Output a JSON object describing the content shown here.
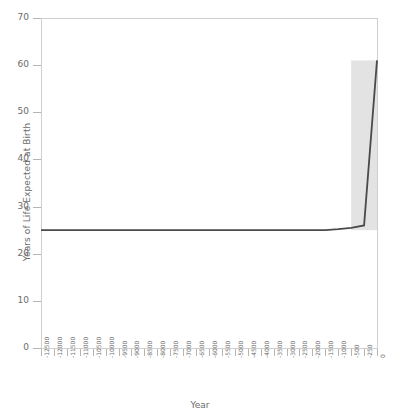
{
  "chart_data": {
    "type": "line",
    "title": "",
    "xlabel": "Year",
    "ylabel": "Years of Life Expected at Birth",
    "ylim": [
      0,
      70
    ],
    "yticks": [
      0,
      10,
      20,
      30,
      40,
      50,
      60,
      70
    ],
    "grid": false,
    "legend": null,
    "categories": [
      "-12500",
      "-12000",
      "-11500",
      "-11000",
      "-10500",
      "-10000",
      "-9500",
      "-9000",
      "-8500",
      "-8000",
      "-7500",
      "-7000",
      "-6500",
      "-6000",
      "-5500",
      "-5000",
      "-4500",
      "-4000",
      "-3500",
      "-3000",
      "-2500",
      "-2000",
      "-1500",
      "-1000",
      "-500",
      "-250",
      "0"
    ],
    "series": [
      {
        "name": "Life expectancy at birth",
        "color": "#4a4a4a",
        "values": [
          25.0,
          25.0,
          25.0,
          25.0,
          25.0,
          25.0,
          25.0,
          25.0,
          25.0,
          25.0,
          25.0,
          25.0,
          25.0,
          25.0,
          25.0,
          25.0,
          25.0,
          25.0,
          25.0,
          25.0,
          25.0,
          25.0,
          25.0,
          25.2,
          25.5,
          26.0,
          61.0
        ]
      }
    ],
    "band": {
      "name": "uncertainty-band",
      "color": "#e3e3e3",
      "x_start": "-500",
      "x_end": "0",
      "y_low": 25.0,
      "y_high": 61.0
    },
    "annotations": []
  },
  "axes": {
    "y_title": "Years of Life Expected at Birth",
    "x_title": "Year"
  },
  "style": {
    "frame_color": "#cfcfcf",
    "tick_color": "#b5b5b5",
    "text_color": "#6b6b6b",
    "line_color": "#4a4a4a",
    "band_color": "#e3e3e3",
    "background": "#ffffff"
  }
}
